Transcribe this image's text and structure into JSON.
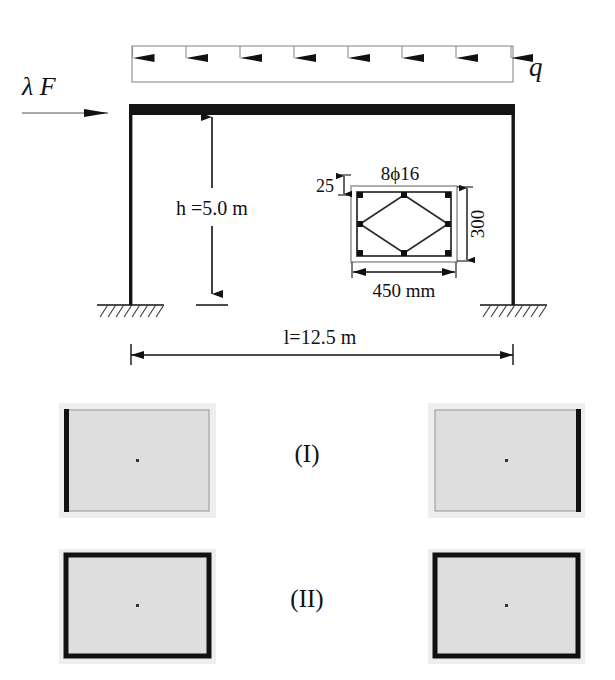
{
  "figure": {
    "background_color": "#ffffff",
    "ink_color": "#000000"
  },
  "frame_diagram": {
    "loads": {
      "distributed_load_label": "q",
      "distributed_load_arrow_count": 8,
      "lateral_force_label": "λ F"
    },
    "dimensions": {
      "height_label": "h =5.0 m",
      "height_value": "5.0",
      "height_symbol": "h",
      "height_unit": "m",
      "span_label": "l=12.5 m",
      "span_value": "12.5",
      "span_symbol": "l",
      "span_unit": "m"
    },
    "supports": {
      "left_support_type": "fixed",
      "right_support_type": "fixed",
      "hatch_line_count": 9
    }
  },
  "cross_section": {
    "rebar_label": "8ϕ16",
    "rebar_count": 8,
    "rebar_diameter_mm": 16,
    "cover_label": "25",
    "cover_unit_implied": "mm",
    "depth_label": "300",
    "width_label": "450 mm",
    "width_value": "450",
    "width_unit": "mm",
    "tie_shape": "diamond"
  },
  "result_panels": {
    "rows": [
      {
        "row_label": "(I)",
        "panels": [
          {
            "name": "left-panel-row-1",
            "edge": "left",
            "fill": "#dedede",
            "edge_color": "#111111"
          },
          {
            "name": "right-panel-row-1",
            "edge": "right",
            "fill": "#dedede",
            "edge_color": "#111111"
          }
        ]
      },
      {
        "row_label": "(II)",
        "panels": [
          {
            "name": "left-panel-row-2",
            "edge": "all",
            "fill": "#dedede",
            "edge_color": "#111111"
          },
          {
            "name": "right-panel-row-2",
            "edge": "all",
            "fill": "#dedede",
            "edge_color": "#111111"
          }
        ]
      }
    ]
  }
}
